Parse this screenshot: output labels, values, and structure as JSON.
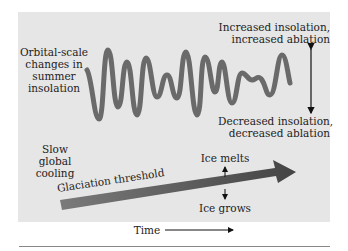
{
  "diagram": {
    "wave_label": [
      "Orbital-scale",
      "changes in",
      "summer",
      "insolation"
    ],
    "top_right_label": [
      "Increased insolation,",
      "increased ablation"
    ],
    "bottom_right_label": [
      "Decreased insolation,",
      "decreased ablation"
    ],
    "cooling_label": [
      "Slow",
      "global",
      "cooling"
    ],
    "threshold_label": "Glaciation threshold",
    "ice_melts_label": "Ice melts",
    "ice_grows_label": "Ice grows",
    "time_label": "Time",
    "colors": {
      "panel": "#e6e6e6",
      "wave": "#6a6a6a",
      "arrow": "#555555",
      "text": "#222222"
    }
  }
}
